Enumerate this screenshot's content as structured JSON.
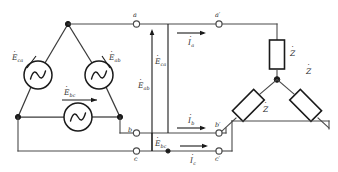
{
  "figure": {
    "kind": "three-phase-circuit-schematic",
    "background_color": "#ffffff",
    "line_color": "#4a4a4a",
    "ink_color": "#1a1a1a"
  },
  "sources": {
    "symbol": "sine-wave-ac-source",
    "items": [
      {
        "id": "src-ca",
        "label": "E",
        "sub": "ca",
        "dot": "̇",
        "text": "Ėca"
      },
      {
        "id": "src-ab",
        "label": "E",
        "sub": "ab",
        "dot": "̇",
        "text": "Ėab"
      },
      {
        "id": "src-bc",
        "label": "E",
        "sub": "bc",
        "dot": "̇",
        "text": "Ėbc"
      }
    ]
  },
  "voltages": [
    {
      "id": "v-ca",
      "label": "E",
      "sub": "ca",
      "text": "Ėca",
      "orientation": "vertical",
      "direction": "up"
    },
    {
      "id": "v-ab",
      "label": "E",
      "sub": "ab",
      "text": "Ėab",
      "orientation": "vertical",
      "direction": "down"
    },
    {
      "id": "v-bc",
      "label": "E",
      "sub": "bc",
      "text": "Ėbc",
      "orientation": "vertical",
      "direction": "down"
    }
  ],
  "currents": [
    {
      "id": "i-a",
      "label": "I",
      "sub": "a",
      "text": "İa",
      "direction": "right"
    },
    {
      "id": "i-b",
      "label": "I",
      "sub": "b",
      "text": "İb",
      "direction": "right"
    },
    {
      "id": "i-c",
      "label": "I",
      "sub": "c",
      "text": "İc",
      "direction": "right"
    }
  ],
  "terminals": {
    "source_side": [
      {
        "id": "term-a",
        "text": "a"
      },
      {
        "id": "term-b",
        "text": "b"
      },
      {
        "id": "term-c",
        "text": "c"
      }
    ],
    "load_side": [
      {
        "id": "term-a-prime",
        "text": "a′"
      },
      {
        "id": "term-b-prime",
        "text": "b′"
      },
      {
        "id": "term-c-prime",
        "text": "c′"
      }
    ]
  },
  "impedances": [
    {
      "id": "z-a",
      "text": "Ż",
      "base": "Z",
      "dot": "̇"
    },
    {
      "id": "z-b",
      "text": "Ż",
      "base": "Z",
      "dot": "̇"
    },
    {
      "id": "z-c",
      "text": "Ż",
      "base": "Z",
      "dot": "̇"
    }
  ]
}
